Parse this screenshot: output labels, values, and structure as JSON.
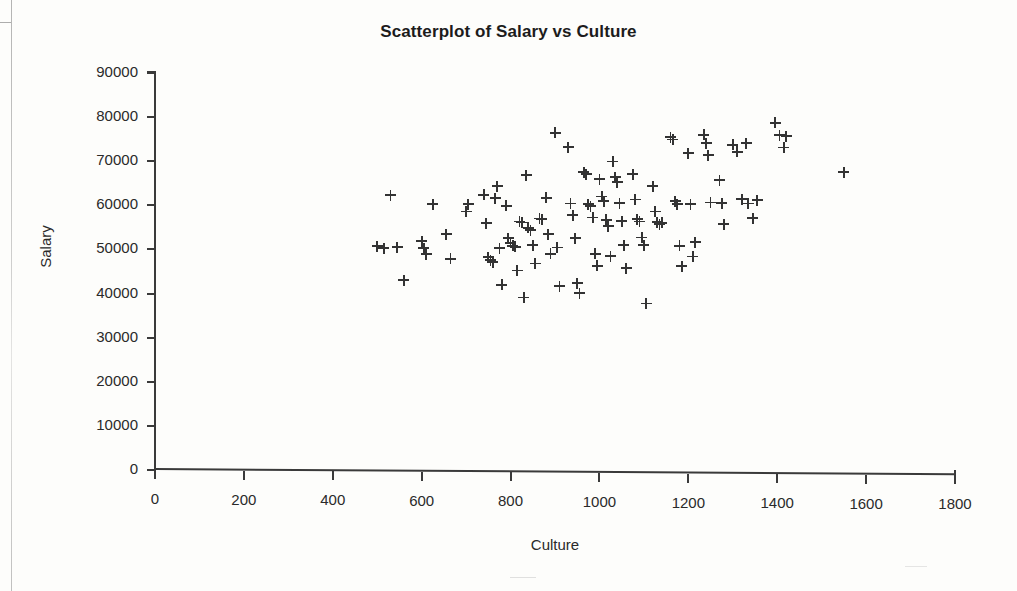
{
  "chart_data": {
    "type": "scatter",
    "title": "Scatterplot of Salary vs Culture",
    "xlabel": "Culture",
    "ylabel": "Salary",
    "xlim": [
      0,
      1800
    ],
    "ylim": [
      0,
      90000
    ],
    "xticks": [
      0,
      200,
      400,
      600,
      800,
      1000,
      1200,
      1400,
      1600,
      1800
    ],
    "yticks": [
      0,
      10000,
      20000,
      30000,
      40000,
      50000,
      60000,
      70000,
      80000,
      90000
    ],
    "grid": false,
    "legend": null,
    "marker": "plus-cross",
    "marker_color": "#333333",
    "series": [
      {
        "name": "Salary vs Culture",
        "points": [
          [
            500,
            50700
          ],
          [
            515,
            50300
          ],
          [
            530,
            62300
          ],
          [
            545,
            50500
          ],
          [
            560,
            43000
          ],
          [
            600,
            51900
          ],
          [
            605,
            50300
          ],
          [
            610,
            48900
          ],
          [
            625,
            60200
          ],
          [
            655,
            53500
          ],
          [
            665,
            47900
          ],
          [
            700,
            58600
          ],
          [
            705,
            60200
          ],
          [
            740,
            62400
          ],
          [
            745,
            55900
          ],
          [
            750,
            48200
          ],
          [
            755,
            47500
          ],
          [
            760,
            47100
          ],
          [
            765,
            61600
          ],
          [
            770,
            64300
          ],
          [
            775,
            50300
          ],
          [
            780,
            42000
          ],
          [
            790,
            59900
          ],
          [
            795,
            52500
          ],
          [
            800,
            51500
          ],
          [
            805,
            50800
          ],
          [
            810,
            50600
          ],
          [
            815,
            45200
          ],
          [
            820,
            56300
          ],
          [
            825,
            56100
          ],
          [
            830,
            39100
          ],
          [
            835,
            66800
          ],
          [
            840,
            54900
          ],
          [
            845,
            54300
          ],
          [
            850,
            51000
          ],
          [
            855,
            46800
          ],
          [
            865,
            57000
          ],
          [
            870,
            56800
          ],
          [
            880,
            61700
          ],
          [
            885,
            53500
          ],
          [
            890,
            49000
          ],
          [
            900,
            76400
          ],
          [
            905,
            50400
          ],
          [
            910,
            41600
          ],
          [
            930,
            73200
          ],
          [
            935,
            60400
          ],
          [
            940,
            57800
          ],
          [
            945,
            52500
          ],
          [
            950,
            42300
          ],
          [
            955,
            40100
          ],
          [
            965,
            67500
          ],
          [
            970,
            67000
          ],
          [
            975,
            60200
          ],
          [
            980,
            59800
          ],
          [
            985,
            57200
          ],
          [
            990,
            49000
          ],
          [
            995,
            46300
          ],
          [
            1000,
            65900
          ],
          [
            1005,
            62000
          ],
          [
            1010,
            60900
          ],
          [
            1015,
            56700
          ],
          [
            1020,
            55300
          ],
          [
            1025,
            48500
          ],
          [
            1030,
            69900
          ],
          [
            1035,
            66400
          ],
          [
            1040,
            65200
          ],
          [
            1045,
            60500
          ],
          [
            1050,
            56400
          ],
          [
            1055,
            51000
          ],
          [
            1060,
            45700
          ],
          [
            1075,
            67000
          ],
          [
            1080,
            61300
          ],
          [
            1085,
            56800
          ],
          [
            1090,
            56300
          ],
          [
            1095,
            52700
          ],
          [
            1100,
            50900
          ],
          [
            1105,
            37700
          ],
          [
            1120,
            64300
          ],
          [
            1125,
            58600
          ],
          [
            1130,
            56200
          ],
          [
            1135,
            55700
          ],
          [
            1140,
            56000
          ],
          [
            1160,
            75400
          ],
          [
            1165,
            74900
          ],
          [
            1170,
            60900
          ],
          [
            1175,
            60300
          ],
          [
            1180,
            50800
          ],
          [
            1185,
            46200
          ],
          [
            1200,
            71800
          ],
          [
            1205,
            60200
          ],
          [
            1210,
            48400
          ],
          [
            1215,
            51600
          ],
          [
            1235,
            76000
          ],
          [
            1240,
            74100
          ],
          [
            1245,
            71400
          ],
          [
            1250,
            60600
          ],
          [
            1270,
            65700
          ],
          [
            1275,
            60500
          ],
          [
            1280,
            55700
          ],
          [
            1300,
            73700
          ],
          [
            1310,
            72100
          ],
          [
            1320,
            61400
          ],
          [
            1330,
            74100
          ],
          [
            1335,
            60400
          ],
          [
            1345,
            57100
          ],
          [
            1355,
            61100
          ],
          [
            1395,
            78700
          ],
          [
            1405,
            75900
          ],
          [
            1415,
            73100
          ],
          [
            1420,
            75700
          ],
          [
            1550,
            67500
          ]
        ]
      }
    ]
  }
}
